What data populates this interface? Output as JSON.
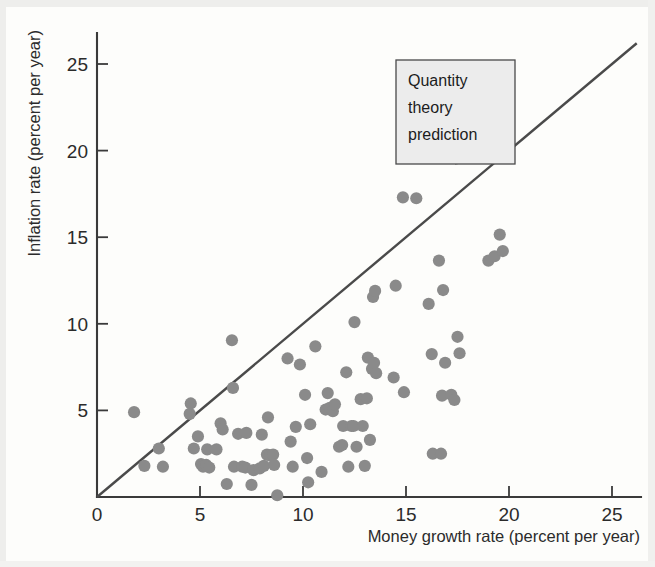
{
  "chart_data": {
    "type": "scatter",
    "title": "",
    "xlabel": "Money growth rate (percent per year)",
    "ylabel": "Inflation rate (percent per year)",
    "xlim": [
      0,
      26.5
    ],
    "ylim": [
      0,
      26.5
    ],
    "xticks": [
      0,
      5,
      10,
      15,
      20,
      25
    ],
    "yticks": [
      5,
      10,
      15,
      20,
      25
    ],
    "xtick_labels": [
      "0",
      "5",
      "10",
      "15",
      "20",
      "25"
    ],
    "ytick_labels": [
      "5",
      "10",
      "15",
      "20",
      "25"
    ],
    "grid": false,
    "legend_position": "none",
    "point_color": "#8a8a8a",
    "line_color": "#4a4a4a",
    "axis_color": "#3a3a3a",
    "annotations": [
      {
        "name": "quantity-theory-prediction",
        "text_lines": [
          "Quantity",
          "theory",
          "prediction"
        ],
        "box_fill": "#ececec",
        "points_to_x": 19.6,
        "points_to_y": 19.6
      }
    ],
    "reference_line": {
      "name": "quantity-theory-prediction-line",
      "description": "45 degree line: inflation equals money growth",
      "x0": 0,
      "y0": 0,
      "x1": 26.2,
      "y1": 26.2
    },
    "points": [
      [
        1.8,
        4.9
      ],
      [
        2.3,
        1.8
      ],
      [
        3.0,
        2.8
      ],
      [
        3.2,
        1.75
      ],
      [
        4.5,
        4.8
      ],
      [
        4.55,
        5.4
      ],
      [
        4.7,
        2.8
      ],
      [
        4.9,
        3.5
      ],
      [
        5.05,
        1.9
      ],
      [
        5.15,
        1.75
      ],
      [
        5.3,
        1.85
      ],
      [
        5.35,
        2.75
      ],
      [
        5.45,
        1.7
      ],
      [
        5.8,
        2.75
      ],
      [
        6.0,
        4.25
      ],
      [
        6.1,
        3.9
      ],
      [
        6.3,
        0.75
      ],
      [
        6.55,
        9.05
      ],
      [
        6.6,
        6.3
      ],
      [
        6.65,
        1.75
      ],
      [
        6.85,
        3.65
      ],
      [
        7.05,
        1.75
      ],
      [
        7.2,
        1.7
      ],
      [
        7.25,
        3.7
      ],
      [
        7.5,
        0.7
      ],
      [
        7.6,
        1.55
      ],
      [
        7.9,
        1.65
      ],
      [
        8.0,
        3.6
      ],
      [
        8.1,
        1.8
      ],
      [
        8.25,
        2.45
      ],
      [
        8.3,
        4.6
      ],
      [
        8.4,
        2.4
      ],
      [
        8.55,
        2.45
      ],
      [
        8.6,
        1.85
      ],
      [
        8.75,
        0.1
      ],
      [
        9.25,
        8.0
      ],
      [
        9.4,
        3.2
      ],
      [
        9.5,
        1.75
      ],
      [
        9.65,
        4.05
      ],
      [
        9.85,
        7.65
      ],
      [
        10.1,
        5.9
      ],
      [
        10.2,
        2.25
      ],
      [
        10.25,
        0.85
      ],
      [
        10.35,
        4.2
      ],
      [
        10.6,
        8.7
      ],
      [
        10.9,
        1.45
      ],
      [
        11.1,
        5.05
      ],
      [
        11.2,
        6.0
      ],
      [
        11.3,
        5.15
      ],
      [
        11.45,
        4.95
      ],
      [
        11.55,
        5.35
      ],
      [
        11.75,
        2.9
      ],
      [
        11.9,
        3.0
      ],
      [
        11.95,
        4.1
      ],
      [
        12.1,
        7.2
      ],
      [
        12.2,
        1.75
      ],
      [
        12.35,
        4.1
      ],
      [
        12.45,
        4.1
      ],
      [
        12.5,
        10.1
      ],
      [
        12.6,
        2.9
      ],
      [
        12.8,
        5.65
      ],
      [
        12.9,
        4.1
      ],
      [
        13.0,
        1.8
      ],
      [
        13.1,
        5.7
      ],
      [
        13.15,
        8.05
      ],
      [
        13.25,
        3.3
      ],
      [
        13.35,
        7.4
      ],
      [
        13.4,
        11.55
      ],
      [
        13.45,
        7.75
      ],
      [
        13.5,
        11.9
      ],
      [
        13.55,
        7.15
      ],
      [
        14.4,
        6.9
      ],
      [
        14.5,
        12.2
      ],
      [
        14.85,
        17.3
      ],
      [
        14.9,
        6.05
      ],
      [
        15.5,
        17.25
      ],
      [
        16.1,
        11.15
      ],
      [
        16.25,
        8.25
      ],
      [
        16.3,
        2.5
      ],
      [
        16.6,
        13.65
      ],
      [
        16.7,
        2.5
      ],
      [
        16.75,
        5.85
      ],
      [
        16.8,
        11.95
      ],
      [
        16.9,
        7.75
      ],
      [
        17.2,
        5.9
      ],
      [
        17.35,
        5.6
      ],
      [
        17.5,
        9.25
      ],
      [
        17.6,
        8.3
      ],
      [
        19.0,
        13.65
      ],
      [
        19.3,
        13.9
      ],
      [
        19.55,
        15.15
      ],
      [
        19.7,
        14.2
      ]
    ]
  }
}
